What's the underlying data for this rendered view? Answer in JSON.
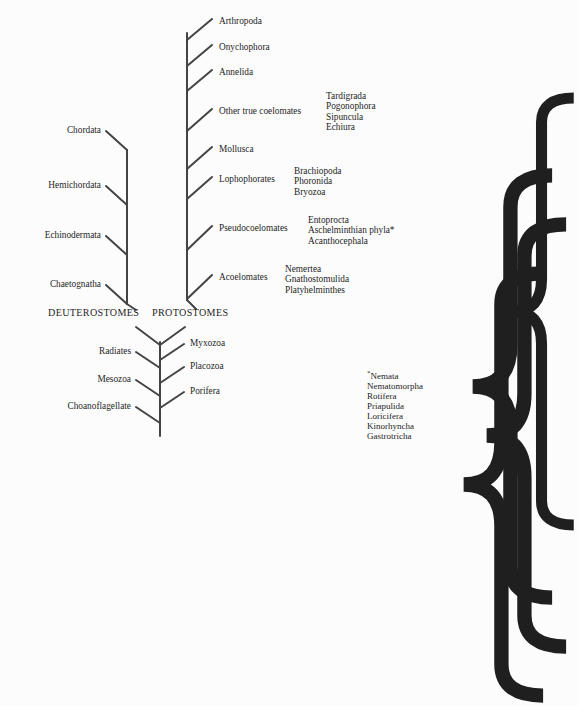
{
  "diagram": {
    "title_caps": {
      "deuterostomes": "DEUTEROSTOMES",
      "protostomes": "PROTOSTOMES"
    },
    "stroke_color": "#444444",
    "text_color": "#1f1f1f",
    "background": "#fcfcfc"
  },
  "protostome_taxa": [
    {
      "label": "Arthropoda",
      "x": 219,
      "y": 22,
      "tip_x": 212,
      "tip_y": 19,
      "node_y": 40
    },
    {
      "label": "Onychophora",
      "x": 219,
      "y": 48,
      "tip_x": 212,
      "tip_y": 45,
      "node_y": 66
    },
    {
      "label": "Annelida",
      "x": 219,
      "y": 73,
      "tip_x": 212,
      "tip_y": 70,
      "node_y": 91
    },
    {
      "label": "Other true coelomates",
      "x": 219,
      "y": 112,
      "tip_x": 212,
      "tip_y": 109,
      "node_y": 131
    },
    {
      "label": "Mollusca",
      "x": 219,
      "y": 150,
      "tip_x": 212,
      "tip_y": 147,
      "node_y": 169
    },
    {
      "label": "Lophophorates",
      "x": 219,
      "y": 180,
      "tip_x": 212,
      "tip_y": 177,
      "node_y": 199
    },
    {
      "label": "Pseudocoelomates",
      "x": 219,
      "y": 229,
      "tip_x": 212,
      "tip_y": 226,
      "node_y": 250
    },
    {
      "label": "Acoelomates",
      "x": 219,
      "y": 278,
      "tip_x": 212,
      "tip_y": 275,
      "node_y": 299
    }
  ],
  "deuterostome_taxa": [
    {
      "label": "Chordata",
      "x": 101,
      "y": 131,
      "tip_x": 106,
      "tip_y": 131,
      "node_y": 150
    },
    {
      "label": "Hemichordata",
      "x": 101,
      "y": 186,
      "tip_x": 106,
      "tip_y": 186,
      "node_y": 205
    },
    {
      "label": "Echinodermata",
      "x": 101,
      "y": 236,
      "tip_x": 106,
      "tip_y": 236,
      "node_y": 255
    },
    {
      "label": "Chaetognatha",
      "x": 101,
      "y": 285,
      "tip_x": 106,
      "tip_y": 285,
      "node_y": 304
    }
  ],
  "basal_left_taxa": [
    {
      "label": "Radiates",
      "x": 131,
      "y": 352,
      "tip_x": 136,
      "tip_y": 352,
      "node_y": 368
    },
    {
      "label": "Mesozoa",
      "x": 131,
      "y": 380,
      "tip_x": 136,
      "tip_y": 380,
      "node_y": 396
    },
    {
      "label": "Choanoflagellate",
      "x": 131,
      "y": 407,
      "tip_x": 136,
      "tip_y": 407,
      "node_y": 423
    }
  ],
  "basal_right_taxa": [
    {
      "label": "Myxozoa",
      "x": 190,
      "y": 344,
      "tip_x": 184,
      "tip_y": 344,
      "node_y": 360
    },
    {
      "label": "Placozoa",
      "x": 190,
      "y": 367,
      "tip_x": 184,
      "tip_y": 367,
      "node_y": 383
    },
    {
      "label": "Porifera",
      "x": 190,
      "y": 392,
      "tip_x": 184,
      "tip_y": 392,
      "node_y": 408
    }
  ],
  "bracket_groups": [
    {
      "name": "other-true-coelomates-group",
      "brace_x": 318,
      "brace_y": 90,
      "brace_height": 44,
      "list_x": 326,
      "list_y": 91,
      "members": [
        "Tardigrada",
        "Pogonophora",
        "Sipuncula",
        "Echiura"
      ]
    },
    {
      "name": "lophophorates-group",
      "brace_x": 286,
      "brace_y": 165,
      "brace_height": 34,
      "list_x": 294,
      "list_y": 166,
      "members": [
        "Brachiopoda",
        "Phoronida",
        "Bryozoa"
      ]
    },
    {
      "name": "pseudocoelomates-group",
      "brace_x": 300,
      "brace_y": 214,
      "brace_height": 34,
      "list_x": 308,
      "list_y": 215,
      "members": [
        "Entoprocta",
        "Aschelminthian phyla*",
        "Acanthocephala"
      ]
    },
    {
      "name": "acoelomates-group",
      "brace_x": 277,
      "brace_y": 263,
      "brace_height": 34,
      "list_x": 285,
      "list_y": 264,
      "members": [
        "Nemertea",
        "Gnathostomulida",
        "Platyhelminthes"
      ]
    }
  ],
  "footnote": {
    "marker": "*",
    "x": 367,
    "y": 368,
    "items": [
      "Nemata",
      "Nematomorpha",
      "Rotifera",
      "Priapulida",
      "Loricifera",
      "Kinorhyncha",
      "Gastrotricha"
    ]
  },
  "labels_position": {
    "deuterostomes_x": 48,
    "deuterostomes_y": 314,
    "protostomes_x": 152,
    "protostomes_y": 314
  },
  "trunks": {
    "protostome_x": 187,
    "deuterostome_x": 127,
    "main_x": 160
  }
}
